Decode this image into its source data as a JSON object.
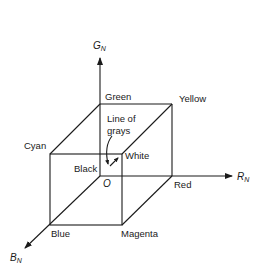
{
  "diagram": {
    "axes": {
      "g": {
        "label": "G",
        "subscript": "N"
      },
      "r": {
        "label": "R",
        "subscript": "N"
      },
      "b": {
        "label": "B",
        "subscript": "N"
      }
    },
    "origin_label": "O",
    "vertices": {
      "green": "Green",
      "yellow": "Yellow",
      "cyan": "Cyan",
      "white": "White",
      "black": "Black",
      "red": "Red",
      "blue": "Blue",
      "magenta": "Magenta"
    },
    "annotation": {
      "line1": "Line of",
      "line2": "grays"
    },
    "colors": {
      "stroke": "#1a1a1a",
      "background": "#ffffff"
    }
  }
}
